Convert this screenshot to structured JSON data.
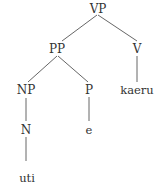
{
  "diagram": {
    "type": "syntax-tree",
    "nodes": [
      {
        "id": "vp",
        "label": "VP",
        "x": 98,
        "y": 3
      },
      {
        "id": "pp",
        "label": "PP",
        "x": 57,
        "y": 43
      },
      {
        "id": "v",
        "label": "V",
        "x": 137,
        "y": 43
      },
      {
        "id": "np",
        "label": "NP",
        "x": 26,
        "y": 84
      },
      {
        "id": "p",
        "label": "P",
        "x": 89,
        "y": 84
      },
      {
        "id": "kaeru",
        "label": "kaeru",
        "x": 137,
        "y": 84
      },
      {
        "id": "n",
        "label": "N",
        "x": 26,
        "y": 124
      },
      {
        "id": "e",
        "label": "e",
        "x": 89,
        "y": 124
      },
      {
        "id": "uti",
        "label": "uti",
        "x": 27,
        "y": 172
      }
    ],
    "edges": [
      {
        "from": "vp",
        "to": "pp",
        "x1": 97,
        "y1": 15,
        "x2": 62,
        "y2": 41
      },
      {
        "from": "vp",
        "to": "v",
        "x1": 98,
        "y1": 15,
        "x2": 137,
        "y2": 41
      },
      {
        "from": "pp",
        "to": "np",
        "x1": 57,
        "y1": 56,
        "x2": 28,
        "y2": 82
      },
      {
        "from": "pp",
        "to": "p",
        "x1": 58,
        "y1": 56,
        "x2": 88,
        "y2": 82
      },
      {
        "from": "v",
        "to": "kaeru",
        "x1": 137,
        "y1": 56,
        "x2": 137,
        "y2": 82
      },
      {
        "from": "np",
        "to": "n",
        "x1": 26,
        "y1": 98,
        "x2": 26,
        "y2": 121
      },
      {
        "from": "p",
        "to": "e",
        "x1": 89,
        "y1": 97,
        "x2": 89,
        "y2": 121
      },
      {
        "from": "n",
        "to": "uti",
        "x1": 26,
        "y1": 137,
        "x2": 26,
        "y2": 161
      }
    ],
    "colors": {
      "text": "#333333",
      "edge": "#555555",
      "background": "#ffffff"
    }
  }
}
